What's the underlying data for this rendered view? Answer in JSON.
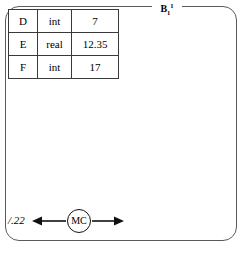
{
  "diagram": {
    "block": {
      "label_base": "B",
      "label_sub": "1",
      "label_sup": "1"
    },
    "table": {
      "columns": [
        "name",
        "type",
        "value"
      ],
      "rows": [
        {
          "name": "D",
          "type": "int",
          "value": "7"
        },
        {
          "name": "E",
          "type": "real",
          "value": "12.35"
        },
        {
          "name": "F",
          "type": "int",
          "value": "17"
        }
      ]
    },
    "control": {
      "node_label": "MC",
      "left_label": "/.22",
      "left_arrow_icon": "arrow-left-icon",
      "right_arrow_icon": "arrow-right-icon"
    },
    "colors": {
      "frame_stroke": "#5a5a5a",
      "table_stroke": "#3a3a3a",
      "ink": "#000000",
      "background": "#ffffff"
    }
  }
}
